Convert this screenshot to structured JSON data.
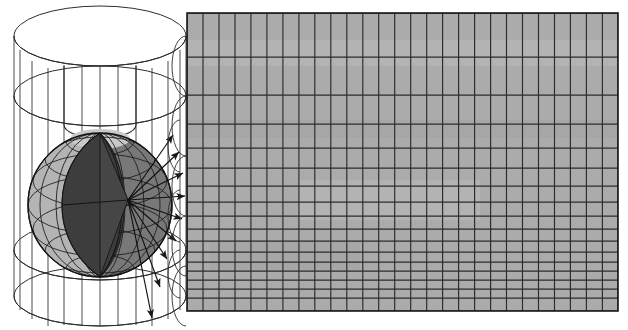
{
  "figure": {
    "background_color": "#ffffff",
    "width": 628,
    "height": 330
  },
  "colors": {
    "stroke": "#1a1a1a",
    "thin_stroke": "#3a3a3a",
    "grid_fill": "#ababab",
    "grid_line": "#2b2b2b",
    "sphere_light": "#b4b4b4",
    "sphere_mid": "#787878",
    "sphere_dark": "#3d3d3d",
    "sphere_cap": "#c9c9c9",
    "cylinder_fill": "none",
    "white": "#ffffff"
  },
  "cylinder": {
    "label": "transparent cylinder circumscribing the sphere",
    "center_x": 100,
    "top_ellipse_cy": 36,
    "bottom_ellipse_cy": 296,
    "rx": 86,
    "ry": 30,
    "second_ellipse_cy": 96,
    "third_ellipse_cy": 250,
    "meridian_count": 13,
    "cut_slit": true,
    "cut_x_left": 64,
    "cut_x_right": 140
  },
  "sphere": {
    "label": "globe with cut-away lune wedge",
    "cx": 100,
    "cy": 205,
    "r": 72,
    "parallels": [
      -60,
      -40,
      -20,
      0,
      20,
      40,
      60
    ],
    "meridian_count": 12,
    "wedge_open": true,
    "wedge_angle_deg": 40,
    "center_point": {
      "x": 128,
      "y": 200
    }
  },
  "rays": {
    "label": "horizontal projection rays from the sphere axis outward",
    "origin": {
      "x": 128,
      "y": 200
    },
    "count": 9,
    "arrow_targets": [
      {
        "x": 173,
        "y": 135
      },
      {
        "x": 179,
        "y": 152
      },
      {
        "x": 183,
        "y": 173
      },
      {
        "x": 184,
        "y": 196
      },
      {
        "x": 182,
        "y": 219
      },
      {
        "x": 176,
        "y": 240
      },
      {
        "x": 167,
        "y": 258
      },
      {
        "x": 160,
        "y": 286
      },
      {
        "x": 152,
        "y": 318
      }
    ]
  },
  "grid": {
    "label": "unrolled cylindrical map graticule",
    "x": 187,
    "y": 13,
    "width": 431,
    "height": 298,
    "columns": 27,
    "column_width": 15.96,
    "row_boundaries_y": [
      13,
      57,
      95,
      124,
      148,
      168,
      186,
      202,
      216,
      229,
      241,
      252,
      262,
      271,
      280,
      289,
      298,
      311
    ],
    "row_count": 11,
    "rows_equal_area": true,
    "fill": "#ababab",
    "line_color": "#2b2b2b"
  }
}
